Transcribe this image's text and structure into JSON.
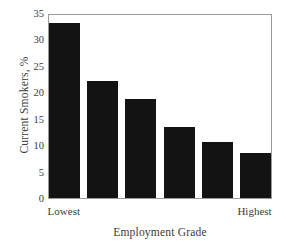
{
  "chart_data": {
    "type": "bar",
    "title": "",
    "xlabel": "Employment Grade",
    "ylabel": "Current Smokers, %",
    "categories": [
      "Lowest",
      "2",
      "3",
      "4",
      "5",
      "Highest"
    ],
    "category_labels_shown": [
      "Lowest",
      "Highest"
    ],
    "values": [
      33.5,
      22.4,
      18.9,
      13.6,
      10.7,
      8.6
    ],
    "ylim": [
      0,
      35
    ],
    "yticks": [
      0,
      5,
      10,
      15,
      20,
      25,
      30,
      35
    ],
    "ytick_labels": [
      "0",
      "5",
      "10",
      "15",
      "20",
      "25",
      "30",
      "35"
    ],
    "grid": false,
    "legend": null,
    "bar_color": "#131313",
    "frame_color": "#9a9a9a",
    "background": "#ffffff"
  }
}
